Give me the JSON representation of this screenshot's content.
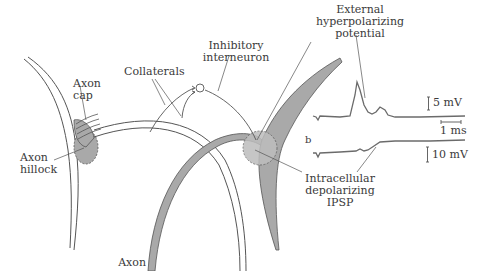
{
  "labels": {
    "external_hyperpolarizing": [
      "External",
      "hyperpolarizing",
      "potential"
    ],
    "inhibitory_interneuron": [
      "Inhibitory",
      "interneuron"
    ],
    "collaterals": "Collaterals",
    "axon_cap": [
      "Axon",
      "cap"
    ],
    "axon_hillock": [
      "Axon",
      "hillock"
    ],
    "axon": "Axon",
    "intracellular_depolarizing": [
      "Intracellular",
      "depolarizing",
      "IPSP"
    ],
    "panel_b": "b",
    "scale_top": "5 mV",
    "scale_time": "1 ms",
    "scale_bottom": "10 mV"
  },
  "colors": {
    "line": "#555555",
    "fill_gray": "#a9a9a9",
    "trace": "#6b6b6b",
    "text": "#3a3a3a",
    "background": "#ffffff"
  },
  "traces": {
    "top": {
      "description": "extracellular recording with spike then small bump",
      "baseline_y": 117,
      "peak_y": 82
    },
    "bottom": {
      "description": "intracellular recording showing depolarizing IPSP step",
      "start_y": 153,
      "end_y": 141
    }
  }
}
